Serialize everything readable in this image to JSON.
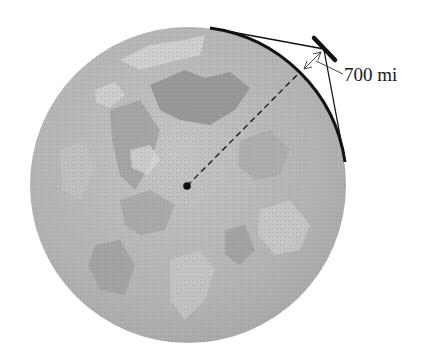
{
  "diagram": {
    "type": "earth-satellite-geometry",
    "globe": {
      "fill": "#b4b4b4",
      "land_dark": "#8e8e8e",
      "land_light": "#d2d2d2"
    },
    "altitude_label": "700 mi",
    "elements": [
      "earth-globe",
      "earth-center-point",
      "satellite",
      "tangent-lines",
      "visible-arc",
      "altitude-arrow",
      "radius-dashed-line"
    ]
  }
}
